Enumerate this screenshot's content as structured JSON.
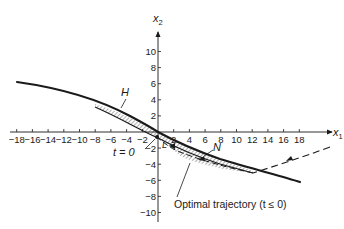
{
  "figure": {
    "x_axis": {
      "label": "x",
      "subscript": "1",
      "ticks": [
        -18,
        -16,
        -14,
        -12,
        -10,
        -8,
        -6,
        -4,
        -2,
        2,
        4,
        6,
        8,
        10,
        12,
        14,
        16,
        18
      ],
      "tick_labels": [
        "−18",
        "−16",
        "−14",
        "−12",
        "−10",
        "−8",
        "−6",
        "−4",
        "−2",
        "2",
        "4",
        "6",
        "8",
        "10",
        "12",
        "14",
        "16",
        "18"
      ]
    },
    "y_axis": {
      "label": "x",
      "subscript": "2",
      "ticks": [
        10,
        8,
        6,
        4,
        2,
        -2,
        -4,
        -6,
        -8,
        -10
      ],
      "tick_labels": [
        "10",
        "8",
        "6",
        "4",
        "2",
        "−2",
        "−4",
        "−6",
        "−8",
        "−10"
      ]
    },
    "labels": {
      "region_upper": "H",
      "region_lower": "N",
      "origin_point": "L",
      "t_zero": "t = 0",
      "trajectory_caption": "Optimal trajectory (t ≤ 0)"
    },
    "colors": {
      "ink": "#1a1a1a",
      "background": "#ffffff"
    }
  },
  "chart_data": {
    "type": "line",
    "title": "",
    "xlabel": "x1",
    "ylabel": "x2",
    "xlim": [
      -18,
      18
    ],
    "ylim": [
      -10,
      10
    ],
    "grid": false,
    "series": [
      {
        "name": "Upper switching boundary",
        "x": [
          -18,
          -14,
          -10,
          -6,
          -4,
          -2,
          0,
          2,
          4,
          6,
          8,
          12,
          16,
          18
        ],
        "y": [
          6.2,
          5.5,
          4.4,
          3.0,
          2.1,
          1.1,
          0.0,
          -1.2,
          -2.1,
          -2.9,
          -3.6,
          -4.8,
          -5.8,
          -6.3
        ]
      },
      {
        "name": "Lower boundary of hatched band",
        "x": [
          -8,
          -6,
          -4,
          -2,
          0,
          2,
          4,
          6,
          8,
          12
        ],
        "y": [
          3.2,
          2.4,
          1.4,
          0.4,
          -0.7,
          -1.9,
          -2.8,
          -3.5,
          -4.0,
          -4.9
        ]
      },
      {
        "name": "Optimal trajectory (t ≤ 0)",
        "style": "dashed",
        "x": [
          22,
          18,
          14,
          12,
          8,
          4,
          2,
          0
        ],
        "y": [
          -2.0,
          -3.5,
          -4.5,
          -5.0,
          -4.2,
          -3.0,
          -2.0,
          -0.6
        ]
      }
    ],
    "annotations": [
      {
        "text": "H",
        "x": -4.5,
        "y": 4.8,
        "points_to": [
          -4,
          1.9
        ]
      },
      {
        "text": "N",
        "x": 7,
        "y": -1.6,
        "points_to": [
          5.5,
          -3.2
        ]
      },
      {
        "text": "L",
        "x": 0.8,
        "y": -1.4
      },
      {
        "text": "t = 0",
        "x": -2.5,
        "y": -2.2,
        "points_to": [
          -0.2,
          -0.6
        ]
      },
      {
        "text": "Optimal trajectory (t ≤ 0)",
        "x": 3,
        "y": -8,
        "points_to": [
          2.5,
          -3.2
        ]
      }
    ]
  }
}
